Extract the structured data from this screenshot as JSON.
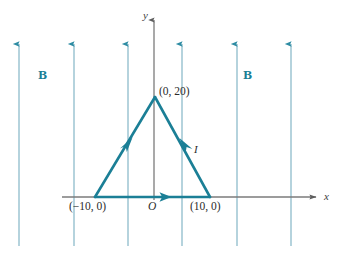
{
  "figure": {
    "domain_type": "diagram",
    "background_color": "#ffffff",
    "width": 338,
    "height": 256
  },
  "colors": {
    "loop_teal": "#1b7f96",
    "field_line_teal": "#9dc4d2",
    "field_arrow_teal": "#2e8ca3",
    "axis_gray": "#7b7b7b",
    "axis_text": "#3d3d3d",
    "point_text": "#2b2b2b"
  },
  "axes": {
    "x_axis": {
      "label": "x",
      "name": "x-axis",
      "y_position": 197,
      "x_start": 62,
      "x_end": 318,
      "arrow": "right"
    },
    "y_axis": {
      "label": "y",
      "name": "y-axis",
      "x_position": 154,
      "y_start": 18,
      "y_end": 200,
      "arrow": "up"
    },
    "origin_label": "O"
  },
  "magnetic_field": {
    "symbol": "B",
    "direction": "up",
    "label_left": "B",
    "label_right": "B",
    "line_count": 6,
    "line_x_positions": [
      19,
      74,
      128,
      182,
      237,
      291
    ],
    "line_top": 42,
    "line_bottom": 246
  },
  "loop": {
    "shape": "triangle",
    "current_label": "I",
    "current_direction": "counterclockwise-as-drawn",
    "vertices": [
      {
        "label": "(−10, 0)",
        "x_px": 95,
        "y_px": 197,
        "x_val": -10,
        "y_val": 0
      },
      {
        "label": "(10, 0)",
        "x_px": 210,
        "y_px": 197,
        "x_val": 10,
        "y_val": 0
      },
      {
        "label": "(0, 20)",
        "x_px": 155,
        "y_px": 97,
        "x_val": 0,
        "y_val": 20
      }
    ],
    "edges": [
      {
        "name": "base-edge",
        "from": "(−10, 0)",
        "to": "(10, 0)",
        "arrow_direction": "right"
      },
      {
        "name": "left-edge",
        "from": "(−10, 0)",
        "to": "(0, 20)",
        "arrow_direction": "up-right"
      },
      {
        "name": "right-edge",
        "from": "(10, 0)",
        "to": "(0, 20)",
        "arrow_direction": "up-left"
      }
    ]
  },
  "labels": {
    "apex_point": "(0, 20)",
    "left_base_point": "(−10, 0)",
    "right_base_point": "(10, 0)",
    "origin": "O",
    "current": "I",
    "field_left": "B",
    "field_right": "B",
    "x_axis": "x",
    "y_axis": "y"
  }
}
